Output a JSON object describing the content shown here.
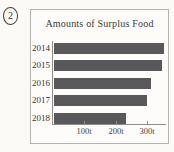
{
  "page": {
    "item_number": "2"
  },
  "chart_data": {
    "type": "bar",
    "orientation": "horizontal",
    "title": "Amounts of Surplus Food",
    "categories": [
      "2014",
      "2015",
      "2016",
      "2017",
      "2018"
    ],
    "values": [
      350,
      345,
      310,
      295,
      230
    ],
    "unit": "t",
    "xlabel": "",
    "ylabel": "",
    "xlim": [
      0,
      360
    ],
    "xticks": [
      {
        "value": 100,
        "label": "100t"
      },
      {
        "value": 200,
        "label": "200t"
      },
      {
        "value": 300,
        "label": "300t"
      }
    ],
    "legend": false,
    "grid": false,
    "bar_color": "#59595b",
    "axis_color": "#8f8d89",
    "frame_border_color": "#b6b3ae"
  }
}
